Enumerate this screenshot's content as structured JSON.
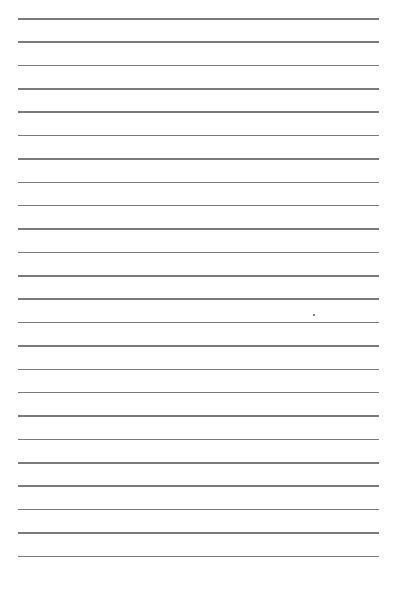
{
  "page": {
    "type": "lined-paper",
    "background_color": "#ffffff",
    "line_color": "#7a7a7a",
    "line_count": 24,
    "line_left": 18,
    "line_right": 379,
    "first_line_y": 18,
    "line_spacing": 23.37,
    "marks": [
      {
        "type": "speck",
        "x": 313,
        "y": 314
      }
    ]
  }
}
